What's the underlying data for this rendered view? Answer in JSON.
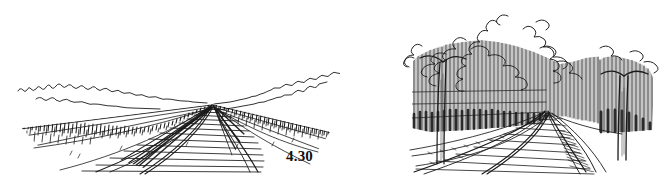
{
  "page": {
    "background_color": "#ffffff",
    "ink_color": "#1a1a1a",
    "width": 667,
    "height": 175
  },
  "figures": [
    {
      "id": "4.30",
      "caption": "4.30",
      "subject": "railway-track-open-landscape",
      "description": "Pen-and-ink one-point perspective sketch of a railroad track receding across flat open country to a vanishing point on a low horizon, with scalloped distant treeline and vertical-stroke scrub grass along both embankments.",
      "vanishing_point": {
        "x": 212,
        "y": 103
      },
      "horizon_y": 103,
      "elements": [
        "distant-scalloped-treeline",
        "left-embankment-scrub",
        "right-embankment-scrub",
        "left-rail",
        "right-rail",
        "cross-ties",
        "ballast-shading",
        "foreground-diagonal-rail"
      ]
    },
    {
      "id": "4.31",
      "caption": "4.31",
      "subject": "railway-track-tree-corridor",
      "description": "Pen-and-ink perspective sketch of a railroad track curving into a dense corridor of tall trees rendered with close vertical hatching, cloud-like scribbled foliage masses above, and a light gravel path on the right.",
      "vanishing_point": {
        "x": 545,
        "y": 108
      },
      "horizon_y": 112,
      "elements": [
        "scribbled-canopy-foliage",
        "vertical-hatch-tree-mass",
        "foreground-tree-trunk-left",
        "foreground-tree-trunk-right",
        "left-rail",
        "right-rail",
        "cross-ties",
        "gravel-path-right",
        "ground-shadow"
      ]
    }
  ],
  "captions": {
    "left": "4.30",
    "right": "4.31"
  }
}
